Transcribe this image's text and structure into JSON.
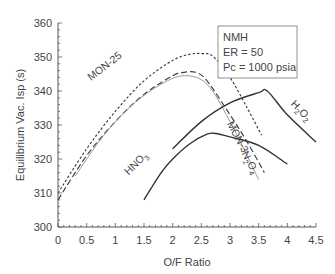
{
  "chart_data": {
    "type": "line",
    "title": "",
    "xlabel": "O/F Ratio",
    "ylabel": "Equilibrium Vac. Isp (s)",
    "xlim": [
      0,
      4.5
    ],
    "ylim": [
      300,
      360
    ],
    "xticks": [
      "0",
      "0.5",
      "1",
      "1.5",
      "2",
      "2.5",
      "3",
      "3.5",
      "4",
      "4.5"
    ],
    "yticks": [
      "300",
      "310",
      "320",
      "330",
      "340",
      "350",
      "360"
    ],
    "grid": false,
    "annotation_box": {
      "lines": [
        "NMH",
        "ER = 50",
        "Pc = 1000 psia"
      ]
    },
    "series": [
      {
        "name": "MON-25",
        "style": "short-dash",
        "color": "#333333",
        "x": [
          0,
          0.5,
          1.0,
          1.5,
          2.0,
          2.3,
          2.5,
          2.7,
          3.0,
          3.3,
          3.55
        ],
        "y": [
          310,
          323,
          334,
          343,
          349,
          350.8,
          351,
          350.2,
          344,
          335,
          327
        ]
      },
      {
        "name": "MON-3",
        "style": "long-dash",
        "color": "#444444",
        "x": [
          0,
          0.5,
          1.0,
          1.5,
          2.0,
          2.2,
          2.4,
          2.6,
          3.0,
          3.3,
          3.6
        ],
        "y": [
          308,
          321,
          331,
          339,
          344.5,
          345.5,
          345.5,
          343,
          333,
          325,
          316
        ]
      },
      {
        "name": "N2O4",
        "style": "thin-solid",
        "color": "#9a9a9a",
        "x": [
          0.3,
          0.8,
          1.3,
          1.8,
          2.2,
          2.6,
          3.0,
          3.5
        ],
        "y": [
          315,
          327,
          336,
          342,
          344.5,
          342,
          331,
          314
        ]
      },
      {
        "name": "H2O2",
        "style": "solid",
        "color": "#333333",
        "x": [
          2.0,
          2.5,
          3.0,
          3.5,
          3.65,
          4.0,
          4.5
        ],
        "y": [
          323,
          331,
          336.5,
          339.5,
          340,
          333,
          325
        ]
      },
      {
        "name": "HNO3",
        "style": "solid",
        "color": "#333333",
        "x": [
          1.5,
          1.8,
          2.0,
          2.3,
          2.6,
          2.75,
          3.0,
          3.5,
          4.0
        ],
        "y": [
          308,
          316,
          320,
          324.5,
          327.3,
          327.5,
          326.5,
          324,
          318.5
        ]
      }
    ],
    "curve_labels": [
      {
        "text": "MON-25",
        "x": 0.85,
        "y": 346.5,
        "rotate": -38
      },
      {
        "text": "MON-3",
        "x": 3.08,
        "y": 326,
        "rotate": 62
      },
      {
        "text": "N2O4",
        "x": 3.3,
        "y": 318.5,
        "rotate": 62
      },
      {
        "text": "H2O2",
        "x": 4.2,
        "y": 333.5,
        "rotate": 45
      },
      {
        "text": "HNO3",
        "x": 1.4,
        "y": 318,
        "rotate": -45
      }
    ]
  }
}
